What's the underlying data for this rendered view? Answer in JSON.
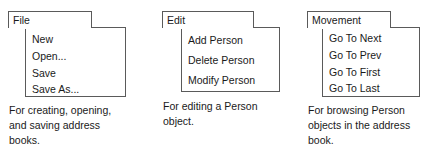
{
  "diagram": {
    "style": {
      "stroke": "#5a5a5a",
      "text": "#1a1a1a",
      "background": "#ffffff"
    },
    "menus": [
      {
        "id": "file",
        "title": "File",
        "items": [
          "New",
          "Open...",
          "Save",
          "Save As..."
        ],
        "caption_lines": [
          "For creating, opening,",
          "and saving address",
          "books."
        ]
      },
      {
        "id": "edit",
        "title": "Edit",
        "items": [
          "Add Person",
          "Delete Person",
          "Modify Person"
        ],
        "caption_lines": [
          "For editing a Person",
          "object."
        ]
      },
      {
        "id": "movement",
        "title": "Movement",
        "items": [
          "Go To Next",
          "Go To Prev",
          "Go To First",
          "Go To Last"
        ],
        "caption_lines": [
          "For browsing Person",
          "objects in the address",
          "book."
        ]
      }
    ]
  }
}
